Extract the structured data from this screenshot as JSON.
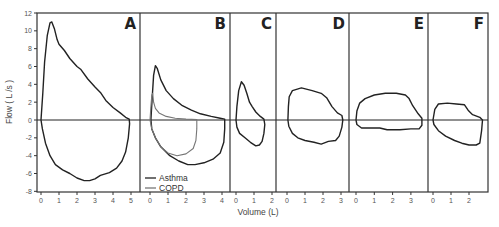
{
  "chart_data": {
    "type": "line",
    "title": "",
    "xlabel": "Volume (L)",
    "ylabel": "Flow ( L /s )",
    "ylim": [
      -8,
      12
    ],
    "yticks": [
      -8,
      -6,
      -4,
      -2,
      0,
      2,
      4,
      6,
      8,
      10,
      12
    ],
    "grid": false,
    "legend": {
      "position": "bottom-left of panel B",
      "entries": [
        {
          "name": "Asthma",
          "color": "#222222"
        },
        {
          "name": "COPD",
          "color": "#777777"
        }
      ]
    },
    "panels": [
      {
        "label": "A",
        "xticks": [
          0,
          1,
          2,
          3,
          4,
          5
        ],
        "series": [
          {
            "name": "Normal",
            "color": "#222222",
            "points": [
              [
                0,
                0
              ],
              [
                0.1,
                3
              ],
              [
                0.2,
                6.5
              ],
              [
                0.35,
                9.5
              ],
              [
                0.5,
                10.9
              ],
              [
                0.6,
                11.0
              ],
              [
                0.75,
                10.2
              ],
              [
                0.9,
                9
              ],
              [
                1.0,
                8.5
              ],
              [
                1.3,
                7.8
              ],
              [
                1.6,
                6.9
              ],
              [
                2.0,
                6.0
              ],
              [
                2.2,
                5.7
              ],
              [
                2.6,
                4.6
              ],
              [
                3.0,
                3.7
              ],
              [
                3.3,
                3.1
              ],
              [
                3.6,
                2.2
              ],
              [
                4.0,
                1.4
              ],
              [
                4.4,
                0.8
              ],
              [
                4.7,
                0.3
              ],
              [
                4.9,
                0.1
              ],
              [
                4.92,
                -0.4
              ],
              [
                4.85,
                -2
              ],
              [
                4.7,
                -3.6
              ],
              [
                4.5,
                -4.6
              ],
              [
                4.2,
                -5.4
              ],
              [
                3.8,
                -5.9
              ],
              [
                3.3,
                -6.2
              ],
              [
                3.0,
                -6.6
              ],
              [
                2.7,
                -6.8
              ],
              [
                2.4,
                -6.8
              ],
              [
                2.0,
                -6.5
              ],
              [
                1.6,
                -6.0
              ],
              [
                1.2,
                -5.6
              ],
              [
                0.8,
                -5.0
              ],
              [
                0.5,
                -4.0
              ],
              [
                0.25,
                -2.6
              ],
              [
                0.08,
                -1.0
              ],
              [
                0,
                0
              ]
            ]
          }
        ]
      },
      {
        "label": "B",
        "xticks": [
          0,
          1,
          2,
          3,
          4
        ],
        "series": [
          {
            "name": "Asthma",
            "color": "#222222",
            "points": [
              [
                0.05,
                0
              ],
              [
                0.12,
                2.5
              ],
              [
                0.2,
                5
              ],
              [
                0.3,
                6.1
              ],
              [
                0.4,
                5.8
              ],
              [
                0.6,
                4.5
              ],
              [
                0.9,
                3.3
              ],
              [
                1.3,
                2.4
              ],
              [
                1.8,
                1.6
              ],
              [
                2.3,
                1.1
              ],
              [
                2.8,
                0.7
              ],
              [
                3.4,
                0.4
              ],
              [
                3.9,
                0.2
              ],
              [
                4.15,
                0.1
              ],
              [
                4.15,
                -1
              ],
              [
                4.1,
                -2.5
              ],
              [
                3.9,
                -3.7
              ],
              [
                3.5,
                -4.4
              ],
              [
                3.0,
                -4.8
              ],
              [
                2.5,
                -5.0
              ],
              [
                2.1,
                -5.0
              ],
              [
                1.6,
                -4.6
              ],
              [
                1.1,
                -4.0
              ],
              [
                0.6,
                -3.0
              ],
              [
                0.3,
                -2.0
              ],
              [
                0.1,
                -1.0
              ],
              [
                0.05,
                0
              ]
            ]
          },
          {
            "name": "COPD",
            "color": "#777777",
            "points": [
              [
                0.0,
                0
              ],
              [
                0.05,
                1.5
              ],
              [
                0.1,
                2.8
              ],
              [
                0.15,
                3.0
              ],
              [
                0.2,
                2.0
              ],
              [
                0.3,
                1.3
              ],
              [
                0.5,
                0.8
              ],
              [
                0.9,
                0.4
              ],
              [
                1.4,
                0.2
              ],
              [
                2.0,
                0.1
              ],
              [
                2.6,
                0.05
              ],
              [
                2.6,
                -1.0
              ],
              [
                2.55,
                -2.3
              ],
              [
                2.4,
                -3.2
              ],
              [
                2.0,
                -3.8
              ],
              [
                1.5,
                -4.0
              ],
              [
                1.0,
                -3.7
              ],
              [
                0.6,
                -3.0
              ],
              [
                0.3,
                -2.0
              ],
              [
                0.1,
                -1.0
              ],
              [
                0.0,
                0
              ]
            ]
          }
        ]
      },
      {
        "label": "C",
        "xticks": [
          0,
          1,
          2
        ],
        "series": [
          {
            "name": "Asthma",
            "color": "#222222",
            "points": [
              [
                0.0,
                0
              ],
              [
                0.05,
                1.5
              ],
              [
                0.15,
                3.3
              ],
              [
                0.3,
                4.3
              ],
              [
                0.45,
                3.9
              ],
              [
                0.6,
                3.0
              ],
              [
                0.75,
                2.0
              ],
              [
                0.9,
                1.5
              ],
              [
                1.1,
                0.9
              ],
              [
                1.35,
                0.4
              ],
              [
                1.55,
                0.1
              ],
              [
                1.6,
                -0.5
              ],
              [
                1.55,
                -1.5
              ],
              [
                1.45,
                -2.4
              ],
              [
                1.3,
                -2.8
              ],
              [
                1.1,
                -2.9
              ],
              [
                0.8,
                -2.5
              ],
              [
                0.5,
                -2.0
              ],
              [
                0.2,
                -1.5
              ],
              [
                0.05,
                -0.8
              ],
              [
                0.0,
                0
              ]
            ]
          }
        ]
      },
      {
        "label": "D",
        "xticks": [
          0,
          1,
          2,
          3
        ],
        "series": [
          {
            "name": "Asthma",
            "color": "#222222",
            "points": [
              [
                0.05,
                0
              ],
              [
                0.08,
                1.5
              ],
              [
                0.12,
                2.6
              ],
              [
                0.3,
                3.3
              ],
              [
                0.8,
                3.6
              ],
              [
                1.4,
                3.3
              ],
              [
                1.9,
                3.0
              ],
              [
                2.2,
                2.5
              ],
              [
                2.5,
                1.5
              ],
              [
                2.8,
                0.8
              ],
              [
                3.05,
                0.5
              ],
              [
                3.1,
                0
              ],
              [
                3.05,
                -0.8
              ],
              [
                2.9,
                -1.8
              ],
              [
                2.7,
                -2.3
              ],
              [
                2.3,
                -2.4
              ],
              [
                1.9,
                -2.7
              ],
              [
                1.5,
                -2.5
              ],
              [
                1.0,
                -2.3
              ],
              [
                0.6,
                -2.0
              ],
              [
                0.3,
                -1.5
              ],
              [
                0.1,
                -0.7
              ],
              [
                0.05,
                0
              ]
            ]
          }
        ]
      },
      {
        "label": "E",
        "xticks": [
          0,
          1,
          2,
          3
        ],
        "series": [
          {
            "name": "Asthma",
            "color": "#222222",
            "points": [
              [
                0.0,
                0
              ],
              [
                0.05,
                1
              ],
              [
                0.2,
                1.9
              ],
              [
                0.5,
                2.4
              ],
              [
                1.0,
                2.8
              ],
              [
                1.6,
                3.0
              ],
              [
                2.2,
                3.0
              ],
              [
                2.7,
                2.8
              ],
              [
                2.9,
                2.4
              ],
              [
                3.1,
                1.6
              ],
              [
                3.4,
                0.7
              ],
              [
                3.6,
                0.2
              ],
              [
                3.6,
                -0.6
              ],
              [
                3.45,
                -1.0
              ],
              [
                3.0,
                -1.0
              ],
              [
                2.4,
                -1.1
              ],
              [
                1.7,
                -1.1
              ],
              [
                1.3,
                -0.9
              ],
              [
                0.8,
                -0.9
              ],
              [
                0.3,
                -0.9
              ],
              [
                0.05,
                -0.5
              ],
              [
                0.0,
                0
              ]
            ]
          }
        ]
      },
      {
        "label": "F",
        "xticks": [
          0,
          1,
          2
        ],
        "series": [
          {
            "name": "Asthma",
            "color": "#222222",
            "points": [
              [
                0.0,
                0
              ],
              [
                0.1,
                1.2
              ],
              [
                0.3,
                1.8
              ],
              [
                0.8,
                1.9
              ],
              [
                1.3,
                1.8
              ],
              [
                1.75,
                1.7
              ],
              [
                1.95,
                1.1
              ],
              [
                2.2,
                0.6
              ],
              [
                2.6,
                0.3
              ],
              [
                2.75,
                0
              ],
              [
                2.7,
                -1.2
              ],
              [
                2.6,
                -2.6
              ],
              [
                2.4,
                -2.8
              ],
              [
                2.0,
                -2.8
              ],
              [
                1.6,
                -2.6
              ],
              [
                1.2,
                -2.3
              ],
              [
                0.7,
                -1.8
              ],
              [
                0.3,
                -1.2
              ],
              [
                0.05,
                -0.5
              ],
              [
                0.0,
                0
              ]
            ]
          }
        ]
      }
    ]
  }
}
